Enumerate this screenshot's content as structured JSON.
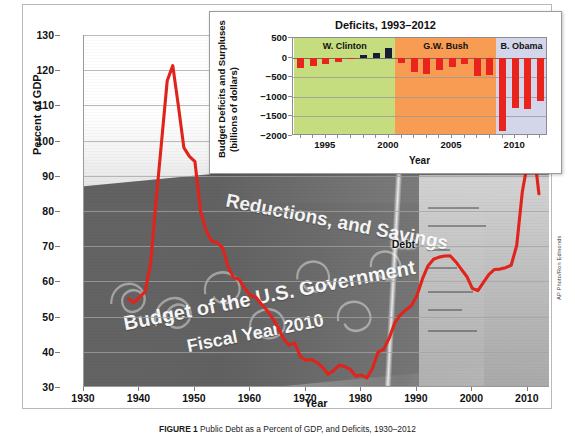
{
  "figure": {
    "caption_label": "FIGURE 1",
    "caption_text": "Public Debt as a Percent of GDP, and Deficits, 1930–2012",
    "credit": "AP Photo/Ron Edmonds",
    "background_watermark": {
      "line1": "Reductions, and Savings",
      "line2": "Budget of the U.S. Government",
      "line3": "Fiscal Year 2010"
    }
  },
  "main_chart": {
    "ylabel": "Percent of GDP",
    "xlabel": "Year",
    "series_label": "Debt"
  },
  "inset_chart": {
    "title": "Deficits, 1993–2012",
    "ylabel_line1": "Budget Deficits and Surpluses",
    "ylabel_line2": "(billions of dollars)",
    "xlabel": "Year",
    "eras": [
      {
        "name": "W. Clinton",
        "color": "#c5dd7f",
        "start": 1993,
        "end": 2000
      },
      {
        "name": "G.W. Bush",
        "color": "#f79c52",
        "start": 2001,
        "end": 2008
      },
      {
        "name": "B. Obama",
        "color": "#d3d6ea",
        "start": 2009,
        "end": 2012
      }
    ],
    "bar_colors": {
      "deficit": "#e8241c",
      "surplus": "#171b33"
    }
  },
  "chart_data": [
    {
      "type": "line",
      "title": "Public Debt as a Percent of GDP",
      "xlabel": "Year",
      "ylabel": "Percent of GDP",
      "series_name": "Debt",
      "color": "#e0231b",
      "grid": true,
      "legend": "none",
      "xlim": [
        1930,
        2014
      ],
      "ylim": [
        30,
        130
      ],
      "ytick_labels": [
        130,
        120,
        110,
        100,
        90,
        80,
        70,
        60,
        50,
        40,
        30
      ],
      "xtick_labels": [
        1930,
        1940,
        1950,
        1960,
        1970,
        1980,
        1990,
        2000,
        2010
      ],
      "x": [
        1938,
        1939,
        1940,
        1941,
        1942,
        1943,
        1944,
        1945,
        1946,
        1947,
        1948,
        1949,
        1950,
        1951,
        1952,
        1953,
        1954,
        1955,
        1956,
        1957,
        1958,
        1959,
        1960,
        1961,
        1962,
        1963,
        1964,
        1965,
        1966,
        1967,
        1968,
        1969,
        1970,
        1971,
        1972,
        1973,
        1974,
        1975,
        1976,
        1977,
        1978,
        1979,
        1980,
        1981,
        1982,
        1983,
        1984,
        1985,
        1986,
        1987,
        1988,
        1989,
        1990,
        1991,
        1992,
        1993,
        1994,
        1995,
        1996,
        1997,
        1998,
        1999,
        2000,
        2001,
        2002,
        2003,
        2004,
        2005,
        2006,
        2007,
        2008,
        2009,
        2010,
        2011,
        2012
      ],
      "y": [
        55.0,
        54.0,
        55.5,
        57.0,
        65.0,
        83.0,
        100.0,
        117.0,
        121.3,
        110.0,
        98.0,
        95.5,
        94.0,
        80.0,
        74.5,
        71.5,
        71.0,
        69.5,
        64.0,
        61.0,
        60.5,
        58.0,
        56.0,
        55.5,
        53.5,
        51.8,
        49.5,
        46.9,
        43.6,
        41.9,
        42.5,
        38.6,
        37.6,
        37.8,
        37.0,
        35.6,
        33.6,
        34.7,
        36.2,
        35.8,
        35.0,
        33.1,
        33.4,
        32.6,
        35.3,
        39.9,
        40.7,
        43.8,
        48.2,
        50.4,
        51.9,
        53.1,
        55.9,
        60.7,
        64.4,
        66.3,
        66.9,
        67.2,
        67.3,
        65.6,
        63.5,
        61.4,
        58.0,
        57.4,
        59.7,
        62.0,
        63.4,
        63.5,
        63.9,
        64.6,
        70.2,
        85.3,
        94.2,
        98.6,
        84.9
      ],
      "annotations": [
        {
          "text": "Debt",
          "x": 1988,
          "y": 70
        }
      ]
    },
    {
      "type": "bar",
      "title": "Deficits, 1993–2012",
      "xlabel": "Year",
      "ylabel": "Budget Deficits and Surpluses (billions of dollars)",
      "grid": true,
      "ylim": [
        -2000,
        500
      ],
      "ytick_labels": [
        500,
        0,
        -500,
        -1000,
        -1500,
        -2000
      ],
      "xtick_labels": [
        1995,
        2000,
        2005,
        2010
      ],
      "categories": [
        1993,
        1994,
        1995,
        1996,
        1997,
        1998,
        1999,
        2000,
        2001,
        2002,
        2003,
        2004,
        2005,
        2006,
        2007,
        2008,
        2009,
        2010,
        2011,
        2012
      ],
      "values": [
        -255,
        -203,
        -164,
        -107,
        -22,
        69,
        126,
        236,
        -128,
        -378,
        -413,
        -318,
        -248,
        -161,
        -459,
        -455,
        -1885,
        -1294,
        -1300,
        -1100
      ],
      "bar_color_rules": {
        "negative": "#e8241c",
        "positive": "#171b33"
      },
      "era_bands": [
        {
          "label": "W. Clinton",
          "years": [
            1993,
            2000
          ],
          "color": "#c5dd7f"
        },
        {
          "label": "G.W. Bush",
          "years": [
            2001,
            2008
          ],
          "color": "#f79c52"
        },
        {
          "label": "B. Obama",
          "years": [
            2009,
            2012
          ],
          "color": "#d3d6ea"
        }
      ]
    }
  ]
}
